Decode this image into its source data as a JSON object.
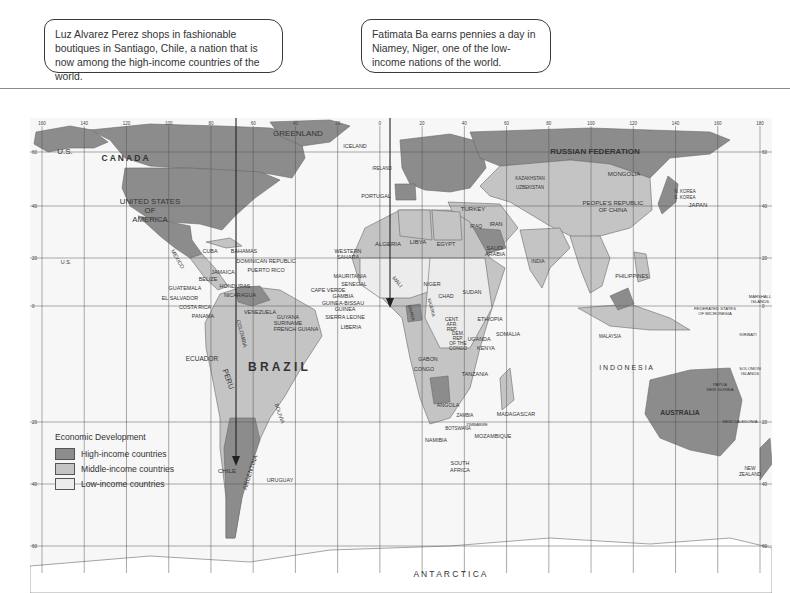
{
  "callouts": [
    {
      "text": "Luz Alvarez Perez shops in fashionable boutiques in Santiago, Chile, a nation that is now among the high-income countries of the world.",
      "points_to": "Chile"
    },
    {
      "text": "Fatimata Ba earns pennies a day in Niamey, Niger, one of the low-income nations of the world.",
      "points_to": "Niger"
    }
  ],
  "legend": {
    "title": "Economic Development",
    "items": [
      {
        "label": "High-income countries",
        "color": "#8c8c8c"
      },
      {
        "label": "Middle-income countries",
        "color": "#c4c4c4"
      },
      {
        "label": "Low-income countries",
        "color": "#ececec"
      }
    ]
  },
  "colors": {
    "ocean": "#f7f7f7",
    "grid": "#555555",
    "high": "#8c8c8c",
    "middle": "#c4c4c4",
    "low": "#ececec"
  },
  "longitude_ticks": [
    "160",
    "140",
    "120",
    "100",
    "80",
    "60",
    "40",
    "20",
    "0",
    "20",
    "40",
    "60",
    "80",
    "100",
    "120",
    "140",
    "160",
    "180"
  ],
  "latitude_ticks": [
    "60",
    "40",
    "20",
    "0",
    "20",
    "40",
    "60"
  ],
  "labels": {
    "us_alaska": "U.S.",
    "canada": "C A N A D A",
    "greenland": "GREENLAND",
    "iceland": "ICELAND",
    "usa": [
      "UNITED STATES",
      "OF",
      "AMERICA"
    ],
    "mexico": "MEXICO",
    "cuba": "CUBA",
    "bahamas": "BAHAMAS",
    "dominican": "DOMINICAN REPUBLIC",
    "puerto_rico": "PUERTO RICO",
    "jamaica": "JAMAICA",
    "belize": "BELIZE",
    "honduras": "HONDURAS",
    "guatemala": "GUATEMALA",
    "el_salvador": "EL SALVADOR",
    "nicaragua": "NICARAGUA",
    "costa_rica": "COSTA RICA",
    "panama": "PANAMA",
    "venezuela": "VENEZUELA",
    "guyana": "GUYANA",
    "suriname": "SURINAME",
    "french_guiana": "FRENCH GUIANA",
    "colombia": "COLOMBIA",
    "ecuador": "ECUADOR",
    "peru": "PERU",
    "brazil": "B R A Z I L",
    "bolivia": "BOLIVIA",
    "chile": "CHILE",
    "argentina": "ARGENTINA",
    "uruguay": "URUGUAY",
    "us_hawaii": "U.S.",
    "russia": "RUSSIAN  FEDERATION",
    "mongolia": "MONGOLIA",
    "china": [
      "PEOPLE'S REPUBLIC",
      "OF CHINA"
    ],
    "japan": "JAPAN",
    "korea_n": "N. KOREA",
    "korea_s": "S. KOREA",
    "kazakhstan": "KAZAKHSTAN",
    "uzbekistan": "UZBEKISTAN",
    "portugal": "PORTUGAL",
    "ireland": "IRELAND",
    "turkey": "TURKEY",
    "iran": "IRAN",
    "iraq": "IRAQ",
    "algeria": "ALGERIA",
    "libya": "LIBYA",
    "egypt": "EGYPT",
    "saudi": [
      "SAUDI",
      "ARABIA"
    ],
    "western_sahara": [
      "WESTERN",
      "SAHARA"
    ],
    "mauritania": "MAURITANIA",
    "senegal": "SENEGAL",
    "cape_verde": "CAPE VERDE",
    "gambia": "GAMBIA",
    "guinea_bissau": "GUINEA-BISSAU",
    "guinea": "GUINEA",
    "sierra_leone": "SIERRA LEONE",
    "liberia": "LIBERIA",
    "mali": "MALI",
    "niger": "NIGER",
    "chad": "CHAD",
    "sudan": "SUDAN",
    "nigeria": "NIGERIA",
    "ghana": "GHANA",
    "ethiopia": "ETHIOPIA",
    "somalia": "SOMALIA",
    "cent_afr": [
      "CENT.",
      "AFR.",
      "REP."
    ],
    "drc": [
      "DEM.",
      "REP.",
      "OF THE",
      "CONGO"
    ],
    "uganda": "UGANDA",
    "kenya": "KENYA",
    "gabon": "GABON",
    "congo": "CONGO",
    "tanzania": "TANZANIA",
    "angola": "ANGOLA",
    "zambia": "ZAMBIA",
    "namibia": "NAMIBIA",
    "botswana": "BOTSWANA",
    "zimbabwe": "ZIMBABWE",
    "mozambique": "MOZAMBIQUE",
    "madagascar": "MADAGASCAR",
    "south_africa": [
      "SOUTH",
      "AFRICA"
    ],
    "india": "INDIA",
    "philippines": "PHILIPPINES",
    "indonesia": "I N D O N E S I A",
    "malaysia": "MALAYSIA",
    "australia": "AUSTRALIA",
    "new_zealand": [
      "NEW",
      "ZEALAND"
    ],
    "png": [
      "PAPUA",
      "NEW GUINEA"
    ],
    "micronesia": [
      "FEDERATED STATES",
      "OF MICRONESIA"
    ],
    "marshall": [
      "MARSHALL",
      "ISLANDS"
    ],
    "kiribati": "KIRIBATI",
    "solomon": [
      "SOLOMON",
      "ISLANDS"
    ],
    "new_caledonia": "NEW CALEDONIA",
    "antarctica": "A N T A R C T I C A"
  }
}
